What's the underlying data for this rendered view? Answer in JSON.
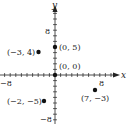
{
  "chart_data": {
    "type": "scatter",
    "title": "",
    "xlabel": "x",
    "ylabel": "y",
    "xlim": [
      -9,
      11
    ],
    "ylim": [
      -9,
      12
    ],
    "grid": false,
    "tick_step": 1,
    "tick_labels": {
      "x": [
        "-8",
        "8"
      ],
      "y": [
        "8",
        "-8"
      ]
    },
    "points": [
      {
        "x": -3,
        "y": 4,
        "label": "(−3, 4)"
      },
      {
        "x": 0,
        "y": 5,
        "label": "(0, 5)"
      },
      {
        "x": 0,
        "y": 0,
        "label": "(0, 0)"
      },
      {
        "x": -2,
        "y": -5,
        "label": "(−2, −5)"
      },
      {
        "x": 7,
        "y": -3,
        "label": "(7, −3)"
      }
    ],
    "color": "#111111"
  },
  "labels": {
    "x_axis": "x",
    "y_axis": "y",
    "x_neg8": "−8",
    "x_pos8": "8",
    "y_pos8": "8",
    "y_neg8": "−8"
  }
}
